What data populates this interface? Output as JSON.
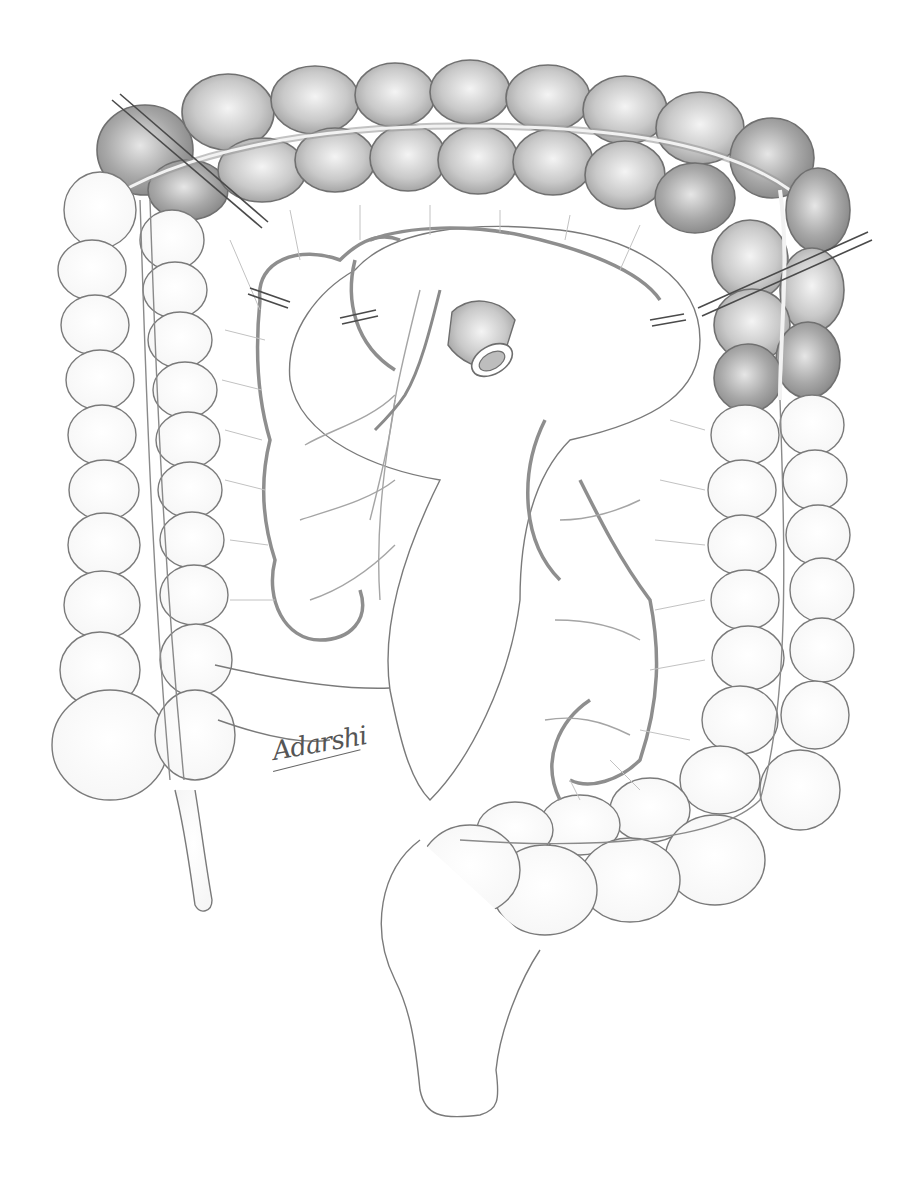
{
  "illustration": {
    "subject": "colon with mesentery, vascular arcades, clamps and anastomosis",
    "signature": "Adarshi",
    "colors": {
      "outline": "#6e6e6e",
      "shaded_colon": "#bdbdbd",
      "shaded_colon_dark": "#9a9a9a",
      "clamp": "#4a4a4a",
      "background": "#ffffff"
    }
  }
}
